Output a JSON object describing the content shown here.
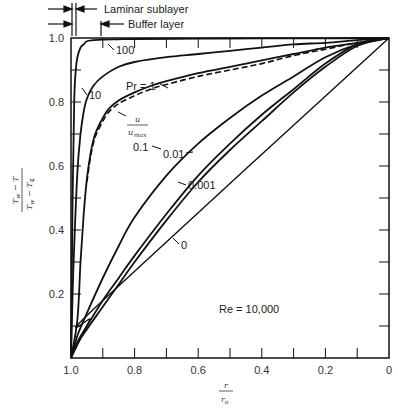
{
  "chart_data": {
    "type": "line",
    "title": "",
    "xlabel": "r / r0",
    "ylabel": "(Tw - T) / (Tw - T_centerline)",
    "xlim": [
      1.0,
      0.0
    ],
    "ylim": [
      0.0,
      1.0
    ],
    "x_ticks": [
      "1.0",
      "0.8",
      "0.6",
      "0.4",
      "0.2",
      "0"
    ],
    "y_ticks": [
      "0.2",
      "0.4",
      "0.6",
      "0.8",
      "1.0"
    ],
    "grid": false,
    "annotations": {
      "laminar_sublayer": "Laminar sublayer",
      "buffer_layer": "Buffer layer",
      "reynolds": "Re = 10,000",
      "velocity_label_num": "u",
      "velocity_label_den": "u",
      "velocity_label_den_sub": "max"
    },
    "series": [
      {
        "name": "Pr = 100",
        "label": "100",
        "style": "solid",
        "x": [
          1.0,
          0.995,
          0.99,
          0.985,
          0.98,
          0.97,
          0.96,
          0.95,
          0.93,
          0.9,
          0.85,
          0.8,
          0.6,
          0.4,
          0.2,
          0.0
        ],
        "y": [
          0.0,
          0.5,
          0.8,
          0.9,
          0.94,
          0.97,
          0.98,
          0.99,
          0.993,
          0.995,
          0.996,
          0.997,
          0.998,
          0.999,
          0.999,
          1.0
        ]
      },
      {
        "name": "Pr = 10",
        "label": "10",
        "style": "solid",
        "x": [
          1.0,
          0.995,
          0.99,
          0.98,
          0.97,
          0.96,
          0.95,
          0.93,
          0.9,
          0.85,
          0.8,
          0.7,
          0.6,
          0.5,
          0.4,
          0.3,
          0.2,
          0.1,
          0.0
        ],
        "y": [
          0.0,
          0.2,
          0.35,
          0.58,
          0.7,
          0.77,
          0.81,
          0.85,
          0.88,
          0.91,
          0.925,
          0.94,
          0.95,
          0.96,
          0.97,
          0.98,
          0.985,
          0.993,
          1.0
        ]
      },
      {
        "name": "Pr = 1",
        "label": "Pr = 1",
        "style": "solid",
        "x": [
          1.0,
          0.98,
          0.97,
          0.96,
          0.95,
          0.94,
          0.93,
          0.92,
          0.9,
          0.88,
          0.85,
          0.8,
          0.75,
          0.7,
          0.6,
          0.5,
          0.4,
          0.3,
          0.2,
          0.1,
          0.0
        ],
        "y": [
          0.0,
          0.12,
          0.3,
          0.45,
          0.56,
          0.63,
          0.68,
          0.71,
          0.75,
          0.78,
          0.805,
          0.83,
          0.85,
          0.865,
          0.89,
          0.91,
          0.93,
          0.95,
          0.97,
          0.985,
          1.0
        ]
      },
      {
        "name": "u/umax",
        "label": "u/umax",
        "style": "dashed",
        "x": [
          0.95,
          0.94,
          0.93,
          0.92,
          0.9,
          0.88,
          0.85,
          0.8,
          0.75,
          0.7,
          0.6,
          0.5,
          0.4,
          0.3,
          0.2,
          0.1,
          0.0
        ],
        "y": [
          0.55,
          0.62,
          0.67,
          0.7,
          0.74,
          0.77,
          0.795,
          0.82,
          0.84,
          0.855,
          0.88,
          0.9,
          0.92,
          0.945,
          0.965,
          0.985,
          1.0
        ]
      },
      {
        "name": "Pr = 0.1",
        "label": "0.1",
        "style": "solid",
        "x": [
          1.0,
          0.98,
          0.95,
          0.9,
          0.85,
          0.8,
          0.7,
          0.6,
          0.5,
          0.4,
          0.3,
          0.2,
          0.1,
          0.0
        ],
        "y": [
          0.0,
          0.07,
          0.14,
          0.25,
          0.35,
          0.44,
          0.57,
          0.67,
          0.75,
          0.82,
          0.88,
          0.94,
          0.98,
          1.0
        ]
      },
      {
        "name": "Pr = 0.01",
        "label": "0.01",
        "style": "solid",
        "x": [
          1.0,
          0.98,
          0.95,
          0.9,
          0.85,
          0.8,
          0.7,
          0.6,
          0.5,
          0.4,
          0.3,
          0.2,
          0.1,
          0.0
        ],
        "y": [
          0.0,
          0.05,
          0.1,
          0.18,
          0.25,
          0.32,
          0.45,
          0.57,
          0.67,
          0.76,
          0.84,
          0.92,
          0.98,
          1.0
        ]
      },
      {
        "name": "Pr = 0.001",
        "label": "0.001",
        "style": "solid",
        "x": [
          1.0,
          0.98,
          0.95,
          0.9,
          0.85,
          0.8,
          0.7,
          0.6,
          0.5,
          0.4,
          0.3,
          0.2,
          0.1,
          0.0
        ],
        "y": [
          0.0,
          0.045,
          0.09,
          0.16,
          0.23,
          0.3,
          0.43,
          0.55,
          0.65,
          0.74,
          0.83,
          0.91,
          0.975,
          1.0
        ]
      },
      {
        "name": "Pr = 0",
        "label": "0",
        "style": "solid",
        "x": [
          1.0,
          0.97,
          0.94,
          0.91,
          0.0
        ],
        "y": [
          0.0,
          0.06,
          0.12,
          0.17,
          1.0
        ]
      }
    ]
  }
}
